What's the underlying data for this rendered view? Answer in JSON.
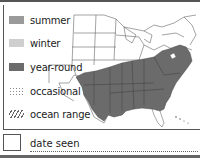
{
  "legend": {
    "items": [
      {
        "key": "summer",
        "label": "summer",
        "color": "#9a9a9a",
        "style": "solid"
      },
      {
        "key": "winter",
        "label": "winter",
        "color": "#cfcfcf",
        "style": "solid"
      },
      {
        "key": "year-round",
        "label": "year-round",
        "color": "#6b6b6b",
        "style": "solid"
      },
      {
        "key": "occasional",
        "label": "occasional",
        "color": "#888888",
        "style": "dotted"
      },
      {
        "key": "ocean-range",
        "label": "ocean range",
        "color": "#666666",
        "style": "hatched"
      }
    ]
  },
  "map": {
    "region": "Eastern United States",
    "range_shown": "year-round",
    "range_color": "#6b6b6b",
    "outline_color": "#555555"
  },
  "footer": {
    "date_label": "date seen"
  }
}
